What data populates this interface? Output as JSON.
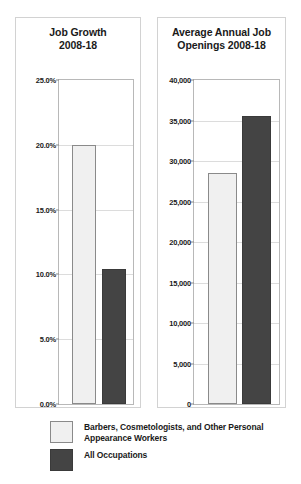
{
  "legend": {
    "items": [
      {
        "label": "Barbers, Cosmetologists, and Other Personal Appearance Workers",
        "swatch": "light-swatch",
        "color": "#f0f0f0"
      },
      {
        "label": "All Occupations",
        "swatch": "dark-swatch",
        "color": "#444444"
      }
    ]
  },
  "chart_data": [
    {
      "type": "bar",
      "title": "Job Growth\n2008-18",
      "title_lines": [
        "Job Growth",
        "2008-18"
      ],
      "xlabel": "",
      "ylabel": "",
      "ylim": [
        0,
        25
      ],
      "yticks": [
        0,
        5,
        10,
        15,
        20,
        25
      ],
      "ytick_labels": [
        "0.0%",
        "5.0%",
        "10.0%",
        "15.0%",
        "20.0%",
        "25.0%"
      ],
      "grid": true,
      "legend_position": "below-figure",
      "categories": [
        "Barbers, Cosmetologists, and Other Personal Appearance Workers",
        "All Occupations"
      ],
      "values": [
        20.0,
        10.4
      ],
      "value_labels": [
        "20.0%",
        "10.4%"
      ],
      "colors": [
        "#f0f0f0",
        "#444444"
      ]
    },
    {
      "type": "bar",
      "title": "Average Annual Job\nOpenings 2008-18",
      "title_lines": [
        "Average Annual Job",
        "Openings 2008-18"
      ],
      "xlabel": "",
      "ylabel": "",
      "ylim": [
        0,
        40000
      ],
      "yticks": [
        0,
        5000,
        10000,
        15000,
        20000,
        25000,
        30000,
        35000,
        40000
      ],
      "ytick_labels": [
        "0",
        "5,000",
        "10,000",
        "15,000",
        "20,000",
        "25,000",
        "30,000",
        "35,000",
        "40,000"
      ],
      "grid": true,
      "legend_position": "below-figure",
      "categories": [
        "Barbers, Cosmetologists, and Other Personal Appearance Workers",
        "All Occupations"
      ],
      "values": [
        28500,
        35600
      ],
      "value_labels": [
        "28,500",
        "35,600"
      ],
      "colors": [
        "#f0f0f0",
        "#444444"
      ]
    }
  ]
}
